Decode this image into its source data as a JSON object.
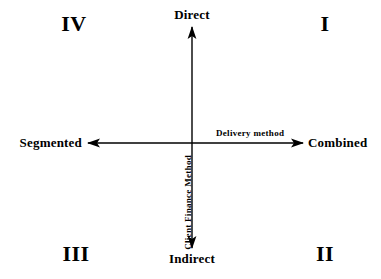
{
  "diagram": {
    "type": "quadrant-matrix",
    "background_color": "#ffffff",
    "line_color": "#000000",
    "vertical_axis": {
      "name": "Client Finance Method",
      "top_label": "Direct",
      "bottom_label": "Indirect"
    },
    "horizontal_axis": {
      "name": "Delivery method",
      "left_label": "Segmented",
      "right_label": "Combined"
    },
    "quadrants": [
      {
        "id": "i",
        "label": "I",
        "position": "top-right"
      },
      {
        "id": "ii",
        "label": "II",
        "position": "bottom-right"
      },
      {
        "id": "iii",
        "label": "III",
        "position": "bottom-left"
      },
      {
        "id": "iv",
        "label": "IV",
        "position": "top-left"
      }
    ]
  }
}
